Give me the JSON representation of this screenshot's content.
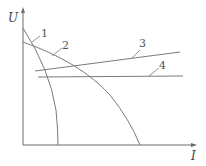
{
  "diagram": {
    "axes": {
      "y_label": "U",
      "x_label": "I"
    },
    "curves": [
      {
        "id": "1",
        "label": "1",
        "type": "curve"
      },
      {
        "id": "2",
        "label": "2",
        "type": "curve"
      },
      {
        "id": "3",
        "label": "3",
        "type": "line"
      },
      {
        "id": "4",
        "label": "4",
        "type": "line"
      }
    ],
    "colors": {
      "line": "#7a7a7a",
      "axis": "#6a6a6a"
    }
  }
}
